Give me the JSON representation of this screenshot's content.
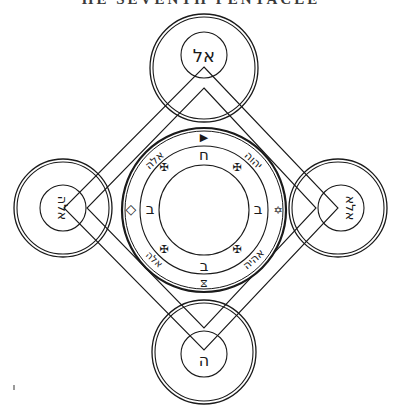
{
  "title": "ΗΕ SEVENTH PENTACLE",
  "colors": {
    "ink": "#1a1a1a",
    "background": "#ffffff"
  },
  "satellites": {
    "top": {
      "label": "אל"
    },
    "left": {
      "label": "אלה"
    },
    "right": {
      "label": "אלא"
    },
    "bottom": {
      "label": "ה"
    }
  },
  "ring": {
    "upper_left_word": "אלה",
    "upper_right_word": "יהוה",
    "lower_left_word": "אלה",
    "lower_right_word": "אהיה",
    "inner_letters": {
      "top": "ח",
      "left": "ב",
      "right": "ב",
      "bottom": "ב"
    },
    "cross_symbol": "✠",
    "top_symbol": "▶",
    "left_symbol": "◇",
    "right_symbol": "✡",
    "bottom_symbol": "⧖"
  }
}
